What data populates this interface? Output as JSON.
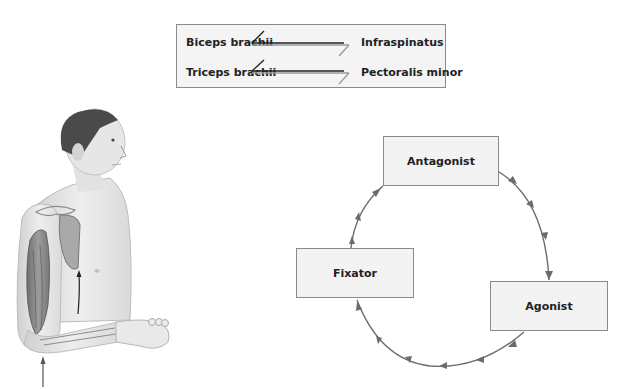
{
  "muscle_pairs": {
    "rows": [
      {
        "left": "Biceps brachii",
        "right": "Infraspinatus"
      },
      {
        "left": "Triceps brachii",
        "right": "Pectoralis minor"
      }
    ],
    "connector_icon": "double-harpoon-arrows"
  },
  "illustration": {
    "subject": "man-upper-body-arm-muscles",
    "arrow_icon": "up-arrow"
  },
  "cycle": {
    "nodes": [
      {
        "id": "antagonist",
        "label": "Antagonist"
      },
      {
        "id": "agonist",
        "label": "Agonist"
      },
      {
        "id": "fixator",
        "label": "Fixator"
      }
    ],
    "direction": "clockwise",
    "arrow_color": "#6b6b6b"
  },
  "colors": {
    "box_fill": "#f3f3f3",
    "box_border": "#8a8a8a",
    "text": "#222222"
  }
}
